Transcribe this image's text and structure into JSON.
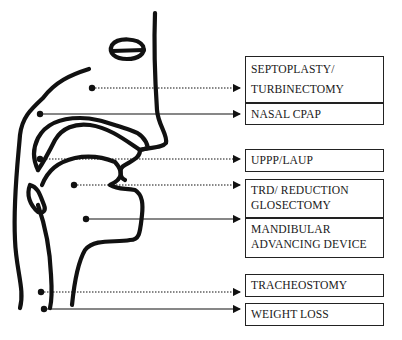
{
  "diagram": {
    "labels": [
      {
        "id": "septoplasty",
        "lines": [
          "SEPTOPLASTY/",
          "TURBINECTOMY"
        ],
        "connector": "dotted"
      },
      {
        "id": "nasal-cpap",
        "lines": [
          "NASAL CPAP"
        ],
        "connector": "solid"
      },
      {
        "id": "uppp",
        "lines": [
          "UPPP/LAUP"
        ],
        "connector": "dotted"
      },
      {
        "id": "trd",
        "lines": [
          "TRD/ REDUCTION",
          "GLOSECTOMY"
        ],
        "connector": "dotted"
      },
      {
        "id": "mandibular",
        "lines": [
          "MANDIBULAR",
          "ADVANCING DEVICE"
        ],
        "connector": "solid"
      },
      {
        "id": "tracheostomy",
        "lines": [
          "TRACHEOSTOMY"
        ],
        "connector": "dotted"
      },
      {
        "id": "weight-loss",
        "lines": [
          "WEIGHT LOSS"
        ],
        "connector": "solid"
      }
    ],
    "colors": {
      "ink": "#111111",
      "background": "#ffffff"
    }
  }
}
